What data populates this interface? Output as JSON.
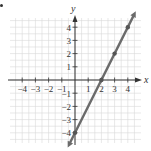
{
  "chart_data": {
    "type": "line",
    "title": "",
    "xlabel": "x",
    "ylabel": "y",
    "xlim": [
      -4.5,
      4.6
    ],
    "ylim": [
      -4.6,
      4.8
    ],
    "grid": true,
    "x_ticks": [
      -4,
      -3,
      -2,
      -1,
      1,
      2,
      3,
      4
    ],
    "y_ticks": [
      -4,
      -3,
      -2,
      -1,
      1,
      2,
      3,
      4
    ],
    "x_tick_labels": [
      "−4",
      "−3",
      "−2",
      "−1",
      "1",
      "2",
      "3",
      "4"
    ],
    "y_tick_labels": [
      "−4",
      "−3",
      "−2",
      "−1",
      "1",
      "2",
      "3",
      "4"
    ],
    "series": [
      {
        "name": "y = 2x − 4",
        "equation": "y = 2x - 4",
        "slope": 2,
        "intercept": -4,
        "points": [
          [
            0,
            -4
          ],
          [
            2,
            0
          ],
          [
            3,
            2
          ],
          [
            4,
            4
          ]
        ],
        "color": "#6b6b6b"
      }
    ]
  },
  "style": {
    "grid_color": "#d9d9d9",
    "axis_color": "#333333",
    "line_color": "#6b6b6b",
    "point_color": "#555555"
  }
}
